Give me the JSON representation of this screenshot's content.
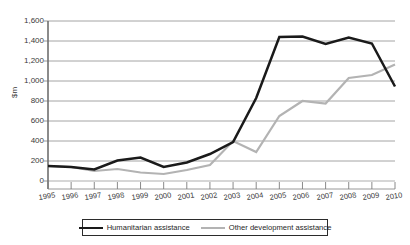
{
  "chart_data": {
    "type": "line",
    "title": "",
    "xlabel": "",
    "ylabel": "$m",
    "ylim": [
      0,
      1600
    ],
    "ytick_step": 200,
    "grid": true,
    "legend_position": "bottom",
    "categories": [
      "1995",
      "1996",
      "1997",
      "1998",
      "1999",
      "2000",
      "2001",
      "2002",
      "2003",
      "2004",
      "2005",
      "2006",
      "2007",
      "2008",
      "2009",
      "2010"
    ],
    "ytick_labels": [
      "0",
      "200",
      "400",
      "600",
      "800",
      "1,000",
      "1,200",
      "1,400",
      "1,600"
    ],
    "series": [
      {
        "name": "Humanitarian assistance",
        "color": "#1a1a1a",
        "values": [
          150,
          140,
          115,
          205,
          235,
          140,
          185,
          270,
          390,
          830,
          1440,
          1445,
          1370,
          1435,
          1375,
          945
        ]
      },
      {
        "name": "Other development assistance",
        "color": "#b3b3b3",
        "values": [
          150,
          140,
          100,
          120,
          85,
          70,
          110,
          160,
          400,
          290,
          650,
          800,
          775,
          1030,
          1060,
          1165
        ]
      }
    ]
  },
  "legend": {
    "entries": [
      {
        "label": "Humanitarian assistance",
        "swatch": "black-line-swatch"
      },
      {
        "label": "Other development assistance",
        "swatch": "gray-line-swatch"
      }
    ]
  },
  "axis": {
    "y_title": "$m"
  }
}
